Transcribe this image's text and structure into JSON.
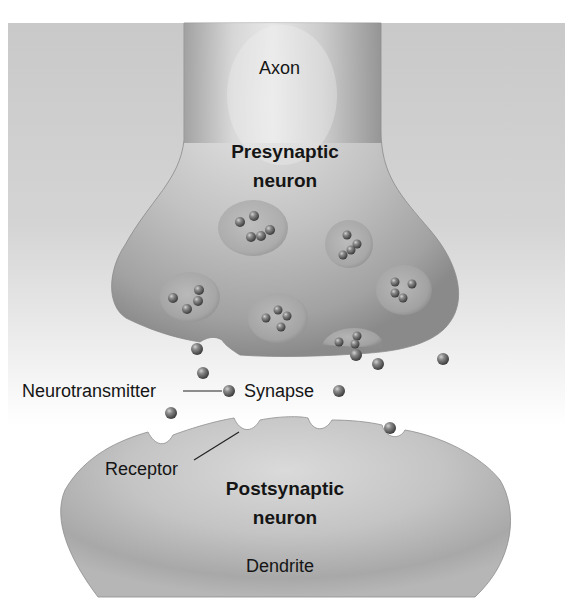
{
  "diagram": {
    "type": "labeled-illustration",
    "labels": {
      "axon": "Axon",
      "presynaptic_line1": "Presynaptic",
      "presynaptic_line2": "neuron",
      "neurotransmitter": "Neurotransmitter",
      "synapse": "Synapse",
      "receptor": "Receptor",
      "postsynaptic_line1": "Postsynaptic",
      "postsynaptic_line2": "neuron",
      "dendrite": "Dendrite"
    },
    "structures": {
      "presynaptic_neuron": {
        "vesicle_count": 7,
        "contains": "synaptic vesicles with neurotransmitters"
      },
      "synaptic_cleft": {
        "free_neurotransmitter_count": 10
      },
      "postsynaptic_neuron": {
        "receptor_count": 4,
        "bound_receptor_count": 1
      }
    },
    "leader_lines": [
      {
        "from": "neurotransmitter",
        "to": "neurotransmitter-molecule"
      },
      {
        "from": "receptor",
        "to": "receptor-site"
      }
    ],
    "colors": {
      "background_panel": "#cfcfcf",
      "neuron_body": "#b4b4b4",
      "neurotransmitter": "#6a6a6a",
      "text": "#151515"
    }
  }
}
